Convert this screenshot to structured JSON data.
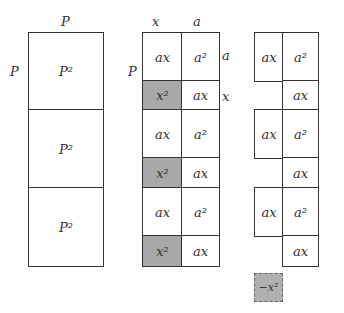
{
  "left": {
    "top_label": "P",
    "side_label": "P",
    "cells": [
      "P²",
      "P²",
      "P²"
    ]
  },
  "middle": {
    "top_labels": [
      "x",
      "a"
    ],
    "side_label": "P",
    "right_labels": [
      "a",
      "x"
    ],
    "cells": [
      [
        "ax",
        "a²"
      ],
      [
        "x²",
        "ax"
      ],
      [
        "ax",
        "a²"
      ],
      [
        "x²",
        "ax"
      ],
      [
        "ax",
        "a²"
      ],
      [
        "x²",
        "ax"
      ]
    ]
  },
  "right": {
    "cells": [
      [
        "ax",
        "a²"
      ],
      [
        "",
        "ax"
      ],
      [
        "ax",
        "a²"
      ],
      [
        "",
        "ax"
      ],
      [
        "ax",
        "a²"
      ],
      [
        "",
        "ax"
      ]
    ]
  },
  "removed": {
    "label": "−x²"
  }
}
